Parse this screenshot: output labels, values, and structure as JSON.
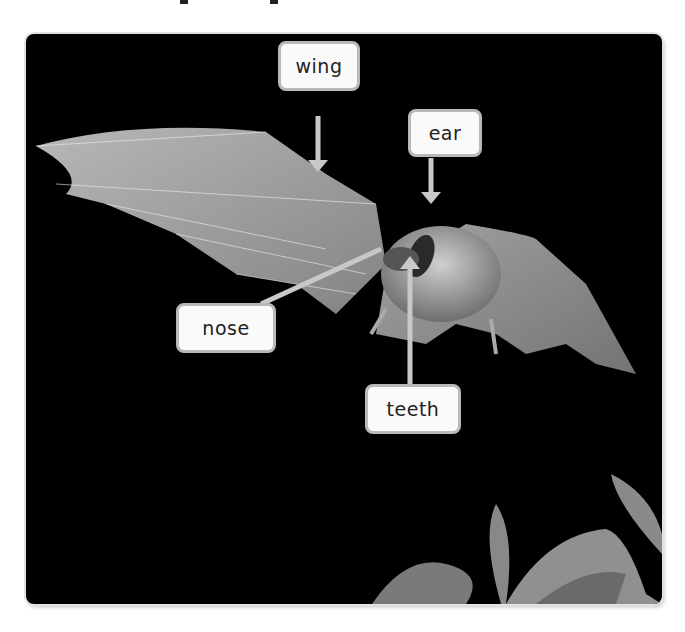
{
  "figure": {
    "background_color": "#000000",
    "label_fill": "#fafafa",
    "label_border": "#b9b9b9",
    "pointer_color": "#c8c8c8"
  },
  "labels": [
    {
      "id": "wing",
      "text": "wing"
    },
    {
      "id": "ear",
      "text": "ear"
    },
    {
      "id": "nose",
      "text": "nose"
    },
    {
      "id": "teeth",
      "text": "teeth"
    }
  ]
}
